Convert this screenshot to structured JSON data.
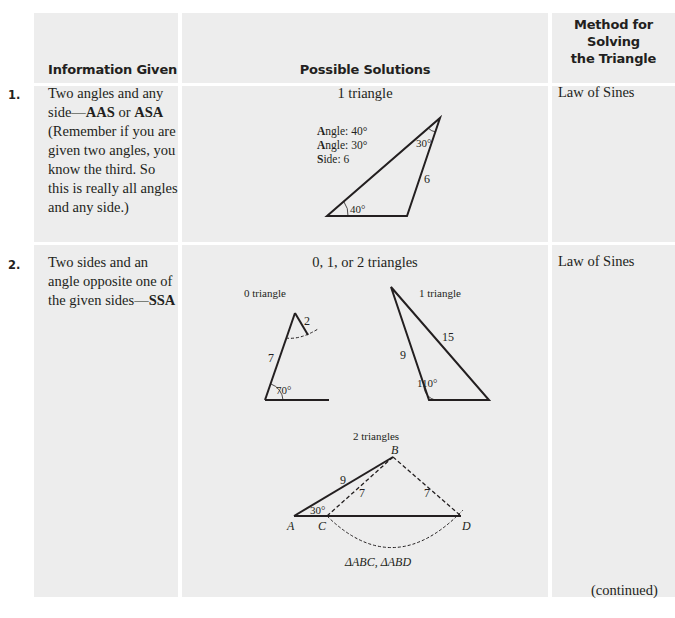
{
  "header": {
    "col1": "Information Given",
    "col2": "Possible Solutions",
    "col3_line1": "Method for",
    "col3_line2": "Solving",
    "col3_line3": "the Triangle"
  },
  "rows": [
    {
      "number": "1.",
      "info_pre": "Two angles and any side—",
      "info_bold1": "AAS",
      "info_mid": " or ",
      "info_bold2": "ASA",
      "info_post": " (Remember if you are given two angles, you know the third. So this is really all angles and any side.)",
      "solutions_title": "1 triangle",
      "legend": [
        {
          "initial": "A",
          "rest": "ngle: 40°"
        },
        {
          "initial": "A",
          "rest": "ngle: 30°"
        },
        {
          "initial": "S",
          "rest": "ide: 6"
        }
      ],
      "diagram_labels": {
        "top_angle": "30°",
        "side": "6",
        "bottom_angle": "40°"
      },
      "method": "Law of Sines"
    },
    {
      "number": "2.",
      "info_pre": "Two sides and an angle opposite one of the given sides—",
      "info_bold1": "SSA",
      "solutions_title": "0, 1, or 2 triangles",
      "zero": {
        "title": "0 triangle",
        "side_short": "2",
        "side_long": "7",
        "angle": "70°"
      },
      "one": {
        "title": "1 triangle",
        "side_a": "15",
        "side_b": "9",
        "angle": "110°"
      },
      "two": {
        "title": "2 triangles",
        "side_ab": "9",
        "side_bc": "7",
        "side_bd": "7",
        "angle": "30°",
        "A": "A",
        "B": "B",
        "C": "C",
        "D": "D",
        "caption": "ΔABC, ΔABD"
      },
      "method": "Law of Sines"
    }
  ],
  "footer": {
    "continued": "(continued)"
  }
}
